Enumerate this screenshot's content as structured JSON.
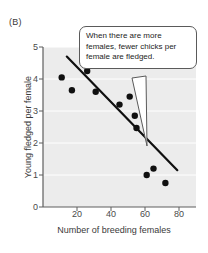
{
  "figure": {
    "panel_label": "(B)"
  },
  "callout": {
    "text": "When there are more females, fewer chicks per female are fledged.",
    "pointer_target": [
      147,
      146
    ]
  },
  "chart_data": {
    "type": "scatter",
    "title": "",
    "xlabel": "Number of breeding females",
    "ylabel": "Young fledged per female",
    "xlim": [
      0,
      90
    ],
    "ylim": [
      0,
      5
    ],
    "xticks": [
      20,
      40,
      60,
      80
    ],
    "yticks": [
      0,
      1,
      2,
      3,
      4,
      5
    ],
    "xtick_labels": [
      "20",
      "40",
      "60",
      "80"
    ],
    "ytick_labels": [
      "0",
      "1",
      "2",
      "3",
      "4",
      "5"
    ],
    "grid": true,
    "grid_color": "#ffffff",
    "plot_background": "#ececec",
    "legend": null,
    "point_color": "#101010",
    "point_radius_px": 3.2,
    "x": [
      11,
      17,
      26,
      31,
      45,
      51,
      54,
      55,
      61,
      65,
      72
    ],
    "y": [
      4.05,
      3.65,
      4.25,
      3.6,
      3.2,
      3.45,
      2.85,
      2.47,
      1.0,
      1.2,
      0.75
    ],
    "points": [
      {
        "x": 11,
        "y": 4.05
      },
      {
        "x": 17,
        "y": 3.65
      },
      {
        "x": 26,
        "y": 4.25
      },
      {
        "x": 31,
        "y": 3.6
      },
      {
        "x": 45,
        "y": 3.2
      },
      {
        "x": 51,
        "y": 3.45
      },
      {
        "x": 54,
        "y": 2.85
      },
      {
        "x": 55,
        "y": 2.47
      },
      {
        "x": 61,
        "y": 1.0
      },
      {
        "x": 65,
        "y": 1.2
      },
      {
        "x": 72,
        "y": 0.75
      }
    ],
    "trendline": {
      "type": "line",
      "color": "#101010",
      "width_px": 2.2,
      "x": [
        14,
        79
      ],
      "y": [
        4.7,
        1.15
      ]
    }
  }
}
